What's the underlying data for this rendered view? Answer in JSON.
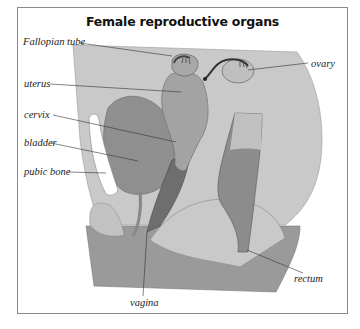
{
  "title": "Female reproductive organs",
  "labels": {
    "fallopian_tube": "Fallopian tube",
    "ovary": "ovary",
    "uterus": "uterus",
    "cervix": "cervix",
    "bladder": "bladder",
    "pubic_bone": "pubic bone",
    "vagina": "vagina",
    "rectum": "rectum"
  },
  "colors": {
    "background_tissue": "#c9c9c9",
    "organ_mid": "#a3a3a3",
    "organ_dark": "#8c8c8c",
    "vagina_dark": "#6e6e6e",
    "floor": "#9a9a9a",
    "bone": "#ffffff",
    "outline": "#555555",
    "leader_line": "#333333"
  }
}
